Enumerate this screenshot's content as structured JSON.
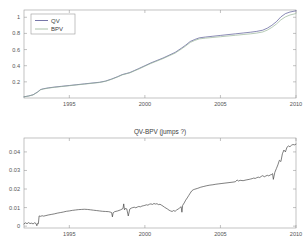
{
  "figure": {
    "background": "#ffffff",
    "axis_color": "#9a9a9a",
    "text_color": "#4a4a4a"
  },
  "chart_data": [
    {
      "type": "line",
      "id": "top-panel",
      "title": "",
      "xlabel": "",
      "ylabel": "",
      "xlim": [
        1992.0,
        2010.0
      ],
      "ylim": [
        0.0,
        1.09
      ],
      "xticks": [
        1995,
        2000,
        2005,
        2010
      ],
      "xtick_labels": [
        "1995",
        "2000",
        "2005",
        "2010"
      ],
      "yticks": [
        0.2,
        0.4,
        0.6,
        0.8,
        1.0
      ],
      "ytick_labels": [
        "0.2",
        "0.4",
        "0.6",
        "0.8",
        "1"
      ],
      "grid": false,
      "legend": {
        "position": "top-left",
        "entries": [
          {
            "name": "QV",
            "color": "#4a4a8c"
          },
          {
            "name": "BPV",
            "color": "#8fae8f"
          }
        ]
      },
      "x": [
        1992.0,
        1992.3,
        1992.6,
        1992.9,
        1993.1,
        1993.3,
        1993.6,
        1994.0,
        1994.5,
        1995.0,
        1995.5,
        1996.0,
        1996.5,
        1997.0,
        1997.4,
        1997.8,
        1998.2,
        1998.5,
        1998.8,
        1999.0,
        1999.3,
        1999.6,
        2000.0,
        2000.4,
        2000.8,
        2001.2,
        2001.6,
        2002.0,
        2002.4,
        2002.7,
        2003.0,
        2003.3,
        2003.6,
        2004.0,
        2004.5,
        2005.0,
        2005.5,
        2006.0,
        2006.5,
        2007.0,
        2007.4,
        2007.8,
        2008.1,
        2008.4,
        2008.7,
        2009.0,
        2009.3,
        2009.6,
        2010.0
      ],
      "series": [
        {
          "name": "QV",
          "color": "#4a4a8c",
          "values": [
            0.015,
            0.025,
            0.04,
            0.075,
            0.105,
            0.115,
            0.125,
            0.135,
            0.145,
            0.155,
            0.165,
            0.175,
            0.185,
            0.195,
            0.21,
            0.235,
            0.265,
            0.29,
            0.305,
            0.315,
            0.34,
            0.365,
            0.4,
            0.435,
            0.465,
            0.495,
            0.53,
            0.565,
            0.615,
            0.655,
            0.7,
            0.725,
            0.745,
            0.755,
            0.765,
            0.775,
            0.785,
            0.795,
            0.805,
            0.815,
            0.825,
            0.84,
            0.865,
            0.9,
            0.945,
            1.005,
            1.045,
            1.065,
            1.08
          ]
        },
        {
          "name": "BPV",
          "color": "#8fae8f",
          "values": [
            0.014,
            0.024,
            0.038,
            0.072,
            0.102,
            0.112,
            0.122,
            0.132,
            0.142,
            0.152,
            0.162,
            0.172,
            0.182,
            0.192,
            0.207,
            0.232,
            0.261,
            0.286,
            0.301,
            0.311,
            0.335,
            0.359,
            0.394,
            0.428,
            0.458,
            0.488,
            0.522,
            0.556,
            0.605,
            0.644,
            0.688,
            0.713,
            0.732,
            0.741,
            0.75,
            0.759,
            0.768,
            0.777,
            0.786,
            0.795,
            0.804,
            0.818,
            0.841,
            0.874,
            0.916,
            0.968,
            1.005,
            1.028,
            1.046
          ]
        }
      ]
    },
    {
      "type": "line",
      "id": "bottom-panel",
      "title": "QV-BPV (jumps ?)",
      "xlabel": "",
      "ylabel": "",
      "xlim": [
        1992.0,
        2010.0
      ],
      "ylim": [
        -0.001,
        0.0475
      ],
      "xticks": [
        1995,
        2000,
        2005,
        2010
      ],
      "xtick_labels": [
        "1995",
        "2000",
        "2005",
        "2010"
      ],
      "yticks": [
        0,
        0.01,
        0.02,
        0.03,
        0.04
      ],
      "ytick_labels": [
        "0",
        "0.01",
        "0.02",
        "0.03",
        "0.04"
      ],
      "grid": false,
      "legend": null,
      "series": [
        {
          "name": "QV-BPV",
          "color": "#3a3a3a",
          "x": [
            1992.0,
            1992.1,
            1992.2,
            1992.3,
            1992.4,
            1992.5,
            1992.6,
            1992.7,
            1992.8,
            1992.85,
            1992.9,
            1992.95,
            1993.0,
            1993.1,
            1993.2,
            1993.3,
            1993.45,
            1993.6,
            1993.8,
            1994.0,
            1994.2,
            1994.4,
            1994.6,
            1994.8,
            1995.0,
            1995.2,
            1995.4,
            1995.6,
            1995.8,
            1996.0,
            1996.2,
            1996.4,
            1996.6,
            1996.8,
            1997.0,
            1997.2,
            1997.4,
            1997.6,
            1997.7,
            1997.8,
            1997.85,
            1997.9,
            1998.0,
            1998.2,
            1998.4,
            1998.55,
            1998.6,
            1998.65,
            1998.7,
            1998.8,
            1998.9,
            1999.0,
            1999.1,
            1999.2,
            1999.3,
            1999.4,
            1999.5,
            1999.6,
            1999.7,
            1999.8,
            1999.9,
            2000.0,
            2000.1,
            2000.2,
            2000.3,
            2000.4,
            2000.5,
            2000.6,
            2000.7,
            2000.8,
            2000.9,
            2001.0,
            2001.1,
            2001.2,
            2001.3,
            2001.4,
            2001.5,
            2001.6,
            2001.7,
            2001.8,
            2001.9,
            2002.0,
            2002.1,
            2002.2,
            2002.3,
            2002.4,
            2002.45,
            2002.5,
            2002.6,
            2002.7,
            2002.8,
            2002.9,
            2003.0,
            2003.1,
            2003.2,
            2003.3,
            2003.5,
            2003.7,
            2003.9,
            2004.1,
            2004.3,
            2004.5,
            2004.7,
            2004.9,
            2005.1,
            2005.3,
            2005.5,
            2005.7,
            2005.9,
            2006.0,
            2006.1,
            2006.2,
            2006.3,
            2006.5,
            2006.7,
            2006.9,
            2007.0,
            2007.1,
            2007.2,
            2007.3,
            2007.4,
            2007.5,
            2007.6,
            2007.7,
            2007.8,
            2007.9,
            2008.0,
            2008.1,
            2008.2,
            2008.3,
            2008.4,
            2008.45,
            2008.5,
            2008.6,
            2008.7,
            2008.8,
            2008.9,
            2009.0,
            2009.1,
            2009.2,
            2009.3,
            2009.4,
            2009.5,
            2009.6,
            2009.7,
            2009.8,
            2009.9,
            2010.0
          ],
          "values": [
            0.0012,
            0.0018,
            0.0013,
            0.0019,
            0.0014,
            0.0016,
            0.0012,
            0.0018,
            0.0014,
            0.0002,
            0.0015,
            0.0013,
            0.0055,
            0.0053,
            0.0056,
            0.0054,
            0.0057,
            0.006,
            0.0063,
            0.0066,
            0.007,
            0.0073,
            0.0076,
            0.008,
            0.0082,
            0.0085,
            0.0087,
            0.0089,
            0.009,
            0.0091,
            0.009,
            0.0088,
            0.0086,
            0.0084,
            0.0082,
            0.008,
            0.0079,
            0.0078,
            0.0076,
            0.0073,
            0.005,
            0.0072,
            0.0078,
            0.0082,
            0.0088,
            0.0095,
            0.012,
            0.0088,
            0.0095,
            0.0093,
            0.0055,
            0.0092,
            0.0097,
            0.01,
            0.0102,
            0.0099,
            0.0103,
            0.0106,
            0.0104,
            0.0108,
            0.011,
            0.0112,
            0.0115,
            0.0113,
            0.0118,
            0.012,
            0.0117,
            0.0122,
            0.0119,
            0.0121,
            0.0116,
            0.0118,
            0.0113,
            0.0108,
            0.0102,
            0.0097,
            0.0092,
            0.0086,
            0.0082,
            0.0079,
            0.0084,
            0.008,
            0.0087,
            0.0092,
            0.0098,
            0.0105,
            0.0075,
            0.0112,
            0.0125,
            0.014,
            0.0152,
            0.0165,
            0.0178,
            0.019,
            0.0196,
            0.0199,
            0.0204,
            0.021,
            0.0214,
            0.0218,
            0.0221,
            0.0223,
            0.0226,
            0.0228,
            0.023,
            0.0232,
            0.0234,
            0.0236,
            0.0238,
            0.024,
            0.0249,
            0.0243,
            0.0247,
            0.0245,
            0.0249,
            0.0252,
            0.0254,
            0.0256,
            0.0259,
            0.0257,
            0.0261,
            0.0264,
            0.0262,
            0.0268,
            0.0272,
            0.0266,
            0.027,
            0.0274,
            0.0271,
            0.0276,
            0.0279,
            0.0283,
            0.0252,
            0.029,
            0.031,
            0.033,
            0.0355,
            0.0348,
            0.039,
            0.041,
            0.04,
            0.0425,
            0.0432,
            0.0428,
            0.0436,
            0.044,
            0.0438,
            0.0442,
            0.0445,
            0.0447
          ]
        }
      ]
    }
  ]
}
